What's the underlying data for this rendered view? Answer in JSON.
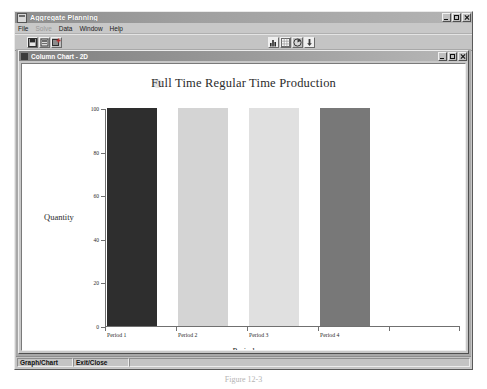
{
  "window": {
    "title": "Aggregate Planning",
    "icon": "application-icon",
    "controls": {
      "minimize": "_",
      "maximize": "□",
      "close": "×"
    }
  },
  "menu": {
    "items": [
      {
        "label": "File",
        "disabled": false
      },
      {
        "label": "Solve",
        "disabled": true
      },
      {
        "label": "Data",
        "disabled": false
      },
      {
        "label": "Window",
        "disabled": false
      },
      {
        "label": "Help",
        "disabled": false
      }
    ]
  },
  "toolbar": {
    "left_buttons": [
      {
        "name": "save-icon"
      },
      {
        "name": "print-icon"
      },
      {
        "name": "new-record-icon"
      }
    ],
    "center_buttons": [
      {
        "name": "bar-chart-icon"
      },
      {
        "name": "table-grid-icon"
      },
      {
        "name": "pie-chart-icon"
      },
      {
        "name": "export-icon"
      }
    ]
  },
  "child_window": {
    "title": "Column Chart - 2D",
    "icon": "chart-document-icon",
    "controls": {
      "minimize": "_",
      "maximize": "□",
      "close": "×"
    }
  },
  "status_bar": {
    "cells": [
      "Graph/Chart",
      "Exit/Close",
      ""
    ]
  },
  "figure_caption": "Figure 12-3",
  "chart_data": {
    "type": "bar",
    "title": "Full Time Regular Time Production",
    "xlabel": "Period",
    "ylabel": "Quantity",
    "categories": [
      "Period 1",
      "Period 2",
      "Period 3",
      "Period 4",
      ""
    ],
    "values": [
      100,
      100,
      100,
      100,
      0
    ],
    "bar_colors": [
      "#2e2e2e",
      "#d4d4d4",
      "#e0e0e0",
      "#787878",
      "#ffffff"
    ],
    "ylim": [
      0,
      100
    ],
    "yticks": [
      0,
      20,
      40,
      60,
      80,
      100
    ],
    "ytick_labels": [
      "0",
      "20",
      "40",
      "60",
      "80",
      "100"
    ],
    "grid": false,
    "legend": "none",
    "legend_marker_color": "#e2e2e2"
  }
}
